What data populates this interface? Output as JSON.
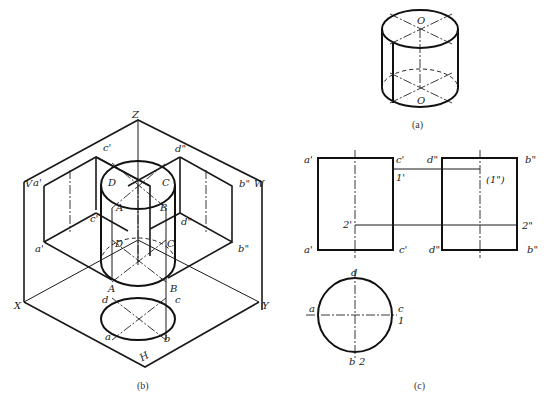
{
  "figure": {
    "captions": {
      "a": "(a)",
      "b": "(b)",
      "c": "(c)"
    },
    "view_a": {
      "labels": {
        "top_center": "O",
        "bottom_center": "O"
      }
    },
    "view_b": {
      "axes": {
        "z": "Z",
        "x": "X",
        "y": "Y"
      },
      "planes": {
        "v": "V",
        "w": "W",
        "h": "H"
      },
      "labels": {
        "a_prime_top": "a'",
        "c_prime_top": "c'",
        "a_prime_bottom": "a'",
        "c_prime_mid": "c'",
        "d2_top": "d\"",
        "b2_top": "b\"",
        "d2_mid": "d\"",
        "b2_bottom": "b\"",
        "D_top": "D",
        "C_top": "C",
        "A_top": "A",
        "B_top": "B",
        "D_bottom": "D",
        "C_bottom": "C",
        "A_bottom": "A",
        "B_bottom": "B",
        "d_h": "d",
        "c_h": "c",
        "a_h": "a",
        "b_h": "b"
      }
    },
    "view_c": {
      "front": {
        "a_top": "a'",
        "c_top": "c'",
        "a_bottom": "a'",
        "c_bottom": "c'",
        "p1": "1'",
        "p2": "2'"
      },
      "side": {
        "d_top": "d\"",
        "b_top": "b\"",
        "d_bottom": "d\"",
        "b_bottom": "b\"",
        "p1": "(1\")",
        "p2": "2\""
      },
      "top": {
        "a": "a",
        "c": "c",
        "d": "d",
        "b": "b",
        "p1": "1",
        "p2": "2"
      }
    }
  }
}
